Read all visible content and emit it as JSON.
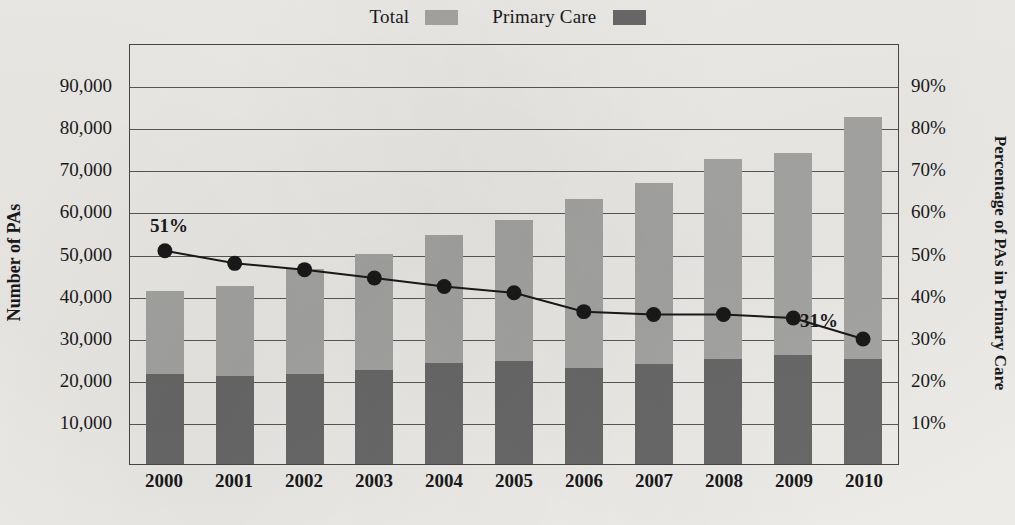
{
  "legend": {
    "entries": [
      {
        "label": "Total",
        "color": "#a9a9a7",
        "swatch": "total-swatch"
      },
      {
        "label": "Primary Care",
        "color": "#6b6b6b",
        "swatch": "primary-care-swatch"
      }
    ]
  },
  "axes": {
    "left_title": "Number of PAs",
    "right_title": "Percentage of PAs in Primary Care",
    "left_ticks": [
      "90,000",
      "80,000",
      "70,000",
      "60,000",
      "50,000",
      "40,000",
      "30,000",
      "20,000",
      "10,000"
    ],
    "right_ticks": [
      "90%",
      "80%",
      "70%",
      "60%",
      "50%",
      "40%",
      "30%",
      "20%",
      "10%"
    ]
  },
  "chart_data": {
    "type": "bar",
    "title": "",
    "xlabel": "",
    "ylabel": "Number of PAs",
    "y2label": "Percentage of PAs in Primary Care",
    "ylim": [
      0,
      100000
    ],
    "y2lim": [
      0,
      100
    ],
    "grid": true,
    "legend_position": "top-center",
    "stacked": true,
    "categories": [
      "2000",
      "2001",
      "2002",
      "2003",
      "2004",
      "2005",
      "2006",
      "2007",
      "2008",
      "2009",
      "2010"
    ],
    "series": [
      {
        "name": "Primary Care",
        "kind": "bar-segment",
        "color": "#6b6b6b",
        "axis": "left",
        "values": [
          21500,
          20800,
          21400,
          22400,
          23900,
          24500,
          22700,
          23800,
          24900,
          26000,
          24900
        ]
      },
      {
        "name": "Total",
        "kind": "bar-segment",
        "color": "#a9a9a7",
        "axis": "left",
        "note": "light segment stacked above Primary Care; totals listed below",
        "totals": [
          41000,
          42400,
          46300,
          50000,
          54400,
          57900,
          62900,
          66700,
          72400,
          73900,
          82400
        ]
      },
      {
        "name": "Percentage of PAs in Primary Care",
        "kind": "line",
        "color": "#1a1a1a",
        "axis": "right",
        "marker": "circle",
        "values": [
          51,
          48,
          46.5,
          44.5,
          42.5,
          41,
          36.5,
          35.8,
          35.8,
          35,
          30
        ]
      }
    ],
    "point_labels": [
      {
        "category": "2000",
        "text": "51%"
      },
      {
        "category": "2010",
        "text": "31%"
      }
    ]
  }
}
